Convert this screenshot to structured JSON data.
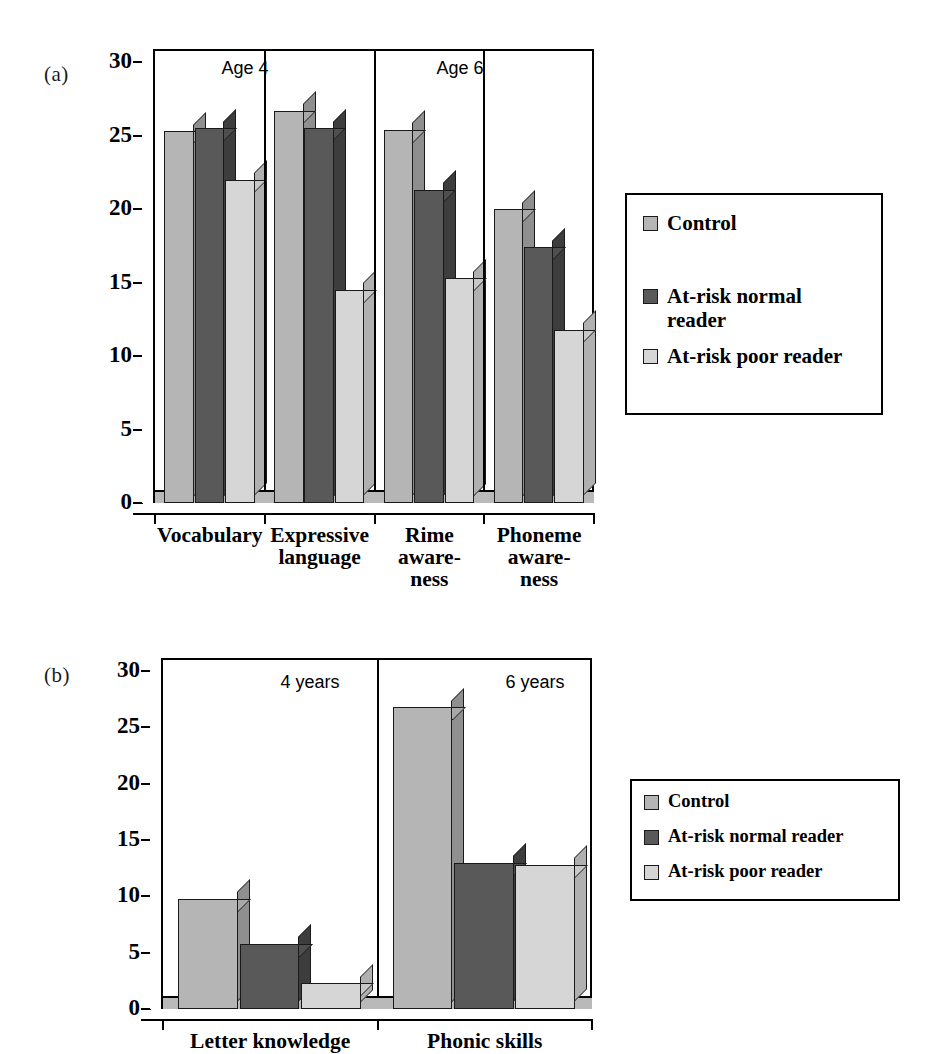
{
  "figure": {
    "panels": [
      {
        "letter": "(a)"
      },
      {
        "letter": "(b)"
      }
    ]
  },
  "colors": {
    "control": "#b5b5b5",
    "at_risk_normal": "#595959",
    "at_risk_poor": "#d6d6d6",
    "control_side": "#8f8f8f",
    "at_risk_normal_side": "#3d3d3d",
    "at_risk_poor_side": "#b0b0b0",
    "control_top": "#a8a8a8",
    "at_risk_normal_top": "#4f4f4f",
    "at_risk_poor_top": "#c8c8c8",
    "axis": "#000000",
    "floor": "#b9b9b9"
  },
  "panel_a": {
    "letter": "(a)",
    "yticks": [
      "0",
      "5",
      "10",
      "15",
      "20",
      "25",
      "30"
    ],
    "group_annotations": [
      {
        "text": "Age 4"
      },
      {
        "text": "Age 6"
      }
    ],
    "legend": {
      "entries": [
        {
          "label": "Control",
          "key": "control"
        },
        {
          "label": "At-risk normal\nreader",
          "key": "at_risk_normal"
        },
        {
          "label": "At-risk poor reader",
          "key": "at_risk_poor"
        }
      ]
    }
  },
  "panel_b": {
    "letter": "(b)",
    "yticks": [
      "0",
      "5",
      "10",
      "15",
      "20",
      "25",
      "30"
    ],
    "group_annotations": [
      {
        "text": "4 years"
      },
      {
        "text": "6 years"
      }
    ],
    "legend": {
      "entries": [
        {
          "label": "Control",
          "key": "control"
        },
        {
          "label": "At-risk normal reader",
          "key": "at_risk_normal"
        },
        {
          "label": "At-risk poor reader",
          "key": "at_risk_poor"
        }
      ]
    }
  },
  "chart_data": [
    {
      "type": "bar",
      "panel": "(a)",
      "title": "",
      "xlabel": "",
      "ylabel": "",
      "ylim": [
        0,
        30
      ],
      "yticks": [
        0,
        5,
        10,
        15,
        20,
        25,
        30
      ],
      "grid": false,
      "legend_position": "right",
      "annotations": [
        "Age 4",
        "Age 6"
      ],
      "categories": [
        "Vocabulary",
        "Expressive language",
        "Rime awareness",
        "Phoneme awareness"
      ],
      "series": [
        {
          "name": "Control",
          "values": [
            25.3,
            26.7,
            25.4,
            20.0
          ]
        },
        {
          "name": "At-risk normal reader",
          "values": [
            25.5,
            25.5,
            21.3,
            17.4
          ]
        },
        {
          "name": "At-risk poor reader",
          "values": [
            22.0,
            14.5,
            15.3,
            11.8
          ]
        }
      ]
    },
    {
      "type": "bar",
      "panel": "(b)",
      "title": "",
      "xlabel": "",
      "ylabel": "",
      "ylim": [
        0,
        30
      ],
      "yticks": [
        0,
        5,
        10,
        15,
        20,
        25,
        30
      ],
      "grid": false,
      "legend_position": "right",
      "annotations": [
        "4 years",
        "6 years"
      ],
      "categories": [
        "Letter knowledge",
        "Phonic skills"
      ],
      "series": [
        {
          "name": "Control",
          "values": [
            9.8,
            26.8
          ]
        },
        {
          "name": "At-risk normal reader",
          "values": [
            5.8,
            13.0
          ]
        },
        {
          "name": "At-risk poor reader",
          "values": [
            2.3,
            12.8
          ]
        }
      ]
    }
  ],
  "xlabels_a": [
    "Vocabulary",
    "Expressive\nlanguage",
    "Rime\naware-\nness",
    "Phoneme\naware-\nness"
  ],
  "xlabels_b": [
    "Letter knowledge",
    "Phonic skills"
  ]
}
